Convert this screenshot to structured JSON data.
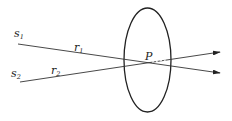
{
  "diagram": {
    "colors": {
      "stroke": "#222222",
      "background": "#ffffff"
    },
    "ellipse": {
      "cx": 147.5,
      "cy": 60,
      "rx": 23.5,
      "ry": 52
    },
    "point": {
      "label": "P",
      "x": 150,
      "y": 63
    },
    "sources": [
      {
        "label": "s",
        "sub": "1",
        "x": 18,
        "y": 44
      },
      {
        "label": "s",
        "sub": "2",
        "x": 20,
        "y": 82
      }
    ],
    "rays": [
      {
        "label": "r",
        "sub": "1",
        "from": [
          18,
          44
        ],
        "to": [
          220,
          73
        ]
      },
      {
        "label": "r",
        "sub": "2",
        "from": [
          20,
          82
        ],
        "to": [
          220,
          52
        ]
      }
    ]
  }
}
